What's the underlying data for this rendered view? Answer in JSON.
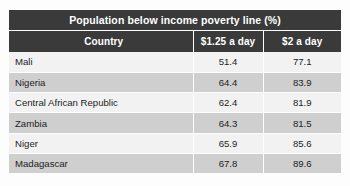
{
  "table": {
    "title": "Population below income poverty line (%)",
    "columns": [
      {
        "key": "country",
        "label": "Country"
      },
      {
        "key": "d125",
        "label": "$1.25 a day"
      },
      {
        "key": "d2",
        "label": "$2 a day"
      }
    ],
    "rows": [
      {
        "country": "Mali",
        "d125": "51.4",
        "d2": "77.1"
      },
      {
        "country": "Nigeria",
        "d125": "64.4",
        "d2": "83.9"
      },
      {
        "country": "Central African Republic",
        "d125": "62.4",
        "d2": "81.9"
      },
      {
        "country": "Zambia",
        "d125": "64.3",
        "d2": "81.5"
      },
      {
        "country": "Niger",
        "d125": "65.9",
        "d2": "85.6"
      },
      {
        "country": "Madagascar",
        "d125": "67.8",
        "d2": "89.6"
      }
    ]
  },
  "chart_data": {
    "type": "table",
    "title": "Population below income poverty line (%)",
    "columns": [
      "Country",
      "$1.25 a day",
      "$2 a day"
    ],
    "categories": [
      "Mali",
      "Nigeria",
      "Central African Republic",
      "Zambia",
      "Niger",
      "Madagascar"
    ],
    "series": [
      {
        "name": "$1.25 a day",
        "values": [
          51.4,
          64.4,
          62.4,
          64.3,
          65.9,
          67.8
        ]
      },
      {
        "name": "$2 a day",
        "values": [
          77.1,
          83.9,
          81.9,
          81.5,
          85.6,
          89.6
        ]
      }
    ],
    "xlabel": "Country",
    "ylabel": "Population below income poverty line (%)",
    "grid": false,
    "legend": "none"
  },
  "colors": {
    "header_background": "#3a3a3a",
    "header_text": "#ffffff",
    "row_light": "#f2f2f2",
    "row_dark": "#cfcfcf",
    "page_background": "#fdfdfd",
    "body_text": "#1d1d1d"
  }
}
